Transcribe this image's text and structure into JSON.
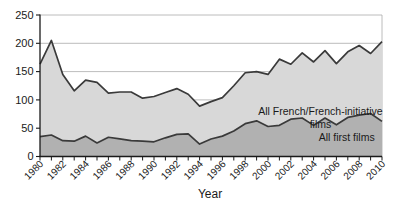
{
  "chart_data": {
    "type": "area",
    "title": "",
    "xlabel": "Year",
    "ylabel": "",
    "ylim": [
      0,
      250
    ],
    "yticks": [
      0,
      50,
      100,
      150,
      200,
      250
    ],
    "xtick_label_step": 2,
    "grid": true,
    "legend_position": "inline-annotations",
    "x": [
      1980,
      1981,
      1982,
      1983,
      1984,
      1985,
      1986,
      1987,
      1988,
      1989,
      1990,
      1991,
      1992,
      1993,
      1994,
      1995,
      1996,
      1997,
      1998,
      1999,
      2000,
      2001,
      2002,
      2003,
      2004,
      2005,
      2006,
      2007,
      2008,
      2009,
      2010
    ],
    "series": [
      {
        "name": "All French/French-initiative films",
        "values": [
          163,
          205,
          145,
          116,
          135,
          131,
          112,
          114,
          114,
          103,
          106,
          113,
          120,
          110,
          89,
          97,
          104,
          125,
          148,
          150,
          145,
          172,
          163,
          183,
          167,
          187,
          164,
          185,
          196,
          182,
          203
        ],
        "fill_color": "#d8d8d8"
      },
      {
        "name": "All first films",
        "values": [
          35,
          38,
          28,
          27,
          36,
          24,
          34,
          31,
          28,
          27,
          26,
          33,
          39,
          40,
          22,
          31,
          36,
          45,
          58,
          63,
          53,
          55,
          66,
          68,
          55,
          68,
          56,
          69,
          73,
          76,
          62
        ],
        "fill_color": "#b1b1b1"
      }
    ],
    "annotations": [
      {
        "lines": [
          "All French/French-initiative",
          "films"
        ],
        "year": 2004.6,
        "value": 74
      },
      {
        "lines": [
          "All first films"
        ],
        "year": 2006.9,
        "value": 27
      }
    ],
    "colors": {
      "line": "#3a3a3a",
      "grid": "#ababab",
      "axis": "#1a1a1a",
      "text": "#1a1a1a"
    }
  }
}
